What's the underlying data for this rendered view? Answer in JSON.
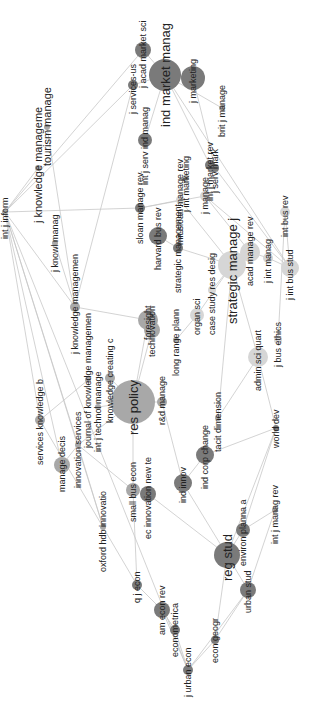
{
  "diagram": {
    "type": "co-citation network map",
    "orientation": "rotated -90deg",
    "colors": {
      "edge": "#c8c8c8",
      "dark": "#7a7a7a",
      "mid": "#a8a8a8",
      "light": "#d6d6d6",
      "label": "#222222"
    },
    "nodes": [
      {
        "id": "ind_market_manag",
        "label": "ind market manag",
        "x": 165,
        "y": 75,
        "r": 16,
        "shade": "dark",
        "fs": 13
      },
      {
        "id": "j_marketing",
        "label": "j marketing",
        "x": 193,
        "y": 78,
        "r": 12,
        "shade": "dark",
        "fs": 9
      },
      {
        "id": "acad_market_sci",
        "label": "j acad market sci",
        "x": 143,
        "y": 50,
        "r": 8,
        "shade": "dark",
        "fs": 9
      },
      {
        "id": "j_services",
        "label": "j services-us",
        "x": 133,
        "y": 85,
        "r": 5,
        "shade": "dark",
        "fs": 9
      },
      {
        "id": "int_j_serv_ind_manag",
        "label": "int j serv ind manag",
        "x": 145,
        "y": 140,
        "r": 7,
        "shade": "dark",
        "fs": 9
      },
      {
        "id": "brit_j_manage",
        "label": "brit j manage",
        "x": 222,
        "y": 108,
        "r": 3,
        "shade": "mid",
        "fs": 9
      },
      {
        "id": "tourism_manage",
        "label": "tourism manage",
        "x": 47,
        "y": 127,
        "r": 3,
        "shade": "mid",
        "fs": 11
      },
      {
        "id": "j_knowledge_manage",
        "label": "j knowledge manageme",
        "x": 38,
        "y": 168,
        "r": 3,
        "shade": "mid",
        "fs": 11
      },
      {
        "id": "int_j_mark",
        "label": "int j market rev",
        "x": 210,
        "y": 165,
        "r": 5,
        "shade": "dark",
        "fs": 9
      },
      {
        "id": "j_serv_mark",
        "label": "j serv mark",
        "x": 215,
        "y": 168,
        "r": 4,
        "shade": "dark",
        "fs": 9
      },
      {
        "id": "sloan_manage_rev",
        "label": "sloan manage rev",
        "x": 140,
        "y": 208,
        "r": 5,
        "shade": "dark",
        "fs": 9
      },
      {
        "id": "mit_sloan_manage_rev",
        "label": "mit sloan manage rev",
        "x": 180,
        "y": 200,
        "r": 4,
        "shade": "light",
        "fs": 9
      },
      {
        "id": "int_marketing",
        "label": "j int marketing",
        "x": 186,
        "y": 178,
        "r": 3,
        "shade": "mid",
        "fs": 9
      },
      {
        "id": "j_manage",
        "label": "j manage",
        "x": 205,
        "y": 196,
        "r": 5,
        "shade": "light",
        "fs": 9
      },
      {
        "id": "harvard_bus_rev",
        "label": "harvard bus rev",
        "x": 158,
        "y": 236,
        "r": 9,
        "shade": "dark",
        "fs": 9
      },
      {
        "id": "strategic_management",
        "label": "strategic management",
        "x": 178,
        "y": 248,
        "r": 5,
        "shade": "dark",
        "fs": 9
      },
      {
        "id": "j_knowl_manag",
        "label": "j knowl manag",
        "x": 55,
        "y": 243,
        "r": 3,
        "shade": "mid",
        "fs": 9
      },
      {
        "id": "knowledge_management",
        "label": "j knowledge managemen",
        "x": 75,
        "y": 307,
        "r": 5,
        "shade": "mid",
        "fs": 9
      },
      {
        "id": "foresight",
        "label": "foresight",
        "x": 148,
        "y": 320,
        "r": 10,
        "shade": "mid",
        "fs": 9
      },
      {
        "id": "technovation",
        "label": "technovation",
        "x": 152,
        "y": 330,
        "r": 8,
        "shade": "mid",
        "fs": 9
      },
      {
        "id": "long_range_plann",
        "label": "long range plann",
        "x": 176,
        "y": 340,
        "r": 3,
        "shade": "mid",
        "fs": 9
      },
      {
        "id": "organ_sci",
        "label": "organ sci",
        "x": 197,
        "y": 315,
        "r": 7,
        "shade": "light",
        "fs": 9
      },
      {
        "id": "case_study_res_desig",
        "label": "case study res desig",
        "x": 212,
        "y": 290,
        "r": 4,
        "shade": "light",
        "fs": 9
      },
      {
        "id": "strategic_manage_j",
        "label": "strategic manage j",
        "x": 232,
        "y": 265,
        "r": 14,
        "shade": "light",
        "fs": 13
      },
      {
        "id": "acad_manage_rev",
        "label": "acad manage rev",
        "x": 250,
        "y": 252,
        "r": 10,
        "shade": "light",
        "fs": 9
      },
      {
        "id": "j_int_manag",
        "label": "j int manag",
        "x": 268,
        "y": 258,
        "r": 5,
        "shade": "light",
        "fs": 9
      },
      {
        "id": "j_int_bus_stud",
        "label": "j int bus stud",
        "x": 290,
        "y": 268,
        "r": 9,
        "shade": "light",
        "fs": 9
      },
      {
        "id": "int_bus_rev",
        "label": "int bus rev",
        "x": 285,
        "y": 212,
        "r": 5,
        "shade": "light",
        "fs": 9
      },
      {
        "id": "j_bus_ethics",
        "label": "j bus ethics",
        "x": 278,
        "y": 340,
        "r": 4,
        "shade": "light",
        "fs": 9
      },
      {
        "id": "admin_sci_quart",
        "label": "admin sci quart",
        "x": 258,
        "y": 357,
        "r": 10,
        "shade": "light",
        "fs": 9
      },
      {
        "id": "res_policy",
        "label": "res policy",
        "x": 133,
        "y": 402,
        "r": 22,
        "shade": "mid",
        "fs": 13
      },
      {
        "id": "knowledge_creating",
        "label": "knowledge creating c",
        "x": 110,
        "y": 378,
        "r": 5,
        "shade": "mid",
        "fs": 9
      },
      {
        "id": "journal_of_knowledge",
        "label": "journal of knowledge managemen",
        "x": 88,
        "y": 380,
        "r": 3,
        "shade": "mid",
        "fs": 9
      },
      {
        "id": "int_j_technol_manage",
        "label": "int j technol manage",
        "x": 98,
        "y": 407,
        "r": 3,
        "shade": "mid",
        "fs": 9
      },
      {
        "id": "services_knowledge",
        "label": "services knowledge b",
        "x": 40,
        "y": 420,
        "r": 5,
        "shade": "mid",
        "fs": 9
      },
      {
        "id": "manage_decis",
        "label": "manage decis",
        "x": 62,
        "y": 465,
        "r": 8,
        "shade": "mid",
        "fs": 9
      },
      {
        "id": "innovation_services",
        "label": "innovation services",
        "x": 78,
        "y": 445,
        "r": 3,
        "shade": "mid",
        "fs": 9
      },
      {
        "id": "rd_manage",
        "label": "r&d manage",
        "x": 162,
        "y": 402,
        "r": 5,
        "shade": "mid",
        "fs": 9
      },
      {
        "id": "tacit_dimension",
        "label": "tacit dimension",
        "x": 218,
        "y": 418,
        "r": 3,
        "shade": "mid",
        "fs": 9
      },
      {
        "id": "world_dev",
        "label": "world dev",
        "x": 276,
        "y": 428,
        "r": 3,
        "shade": "dark",
        "fs": 9
      },
      {
        "id": "small_bus_econ",
        "label": "small bus econ",
        "x": 133,
        "y": 490,
        "r": 7,
        "shade": "mid",
        "fs": 9
      },
      {
        "id": "ec_innovation_new_te",
        "label": "ec innovation new te",
        "x": 148,
        "y": 494,
        "r": 8,
        "shade": "dark",
        "fs": 9
      },
      {
        "id": "ind_innov",
        "label": "ind innov",
        "x": 183,
        "y": 483,
        "r": 9,
        "shade": "dark",
        "fs": 9
      },
      {
        "id": "ind_corp_change",
        "label": "ind corp change",
        "x": 205,
        "y": 455,
        "r": 9,
        "shade": "dark",
        "fs": 9
      },
      {
        "id": "oxford_hdb_innovatio",
        "label": "oxford hdb innovatio",
        "x": 103,
        "y": 527,
        "r": 3,
        "shade": "mid",
        "fs": 9
      },
      {
        "id": "reg_stud",
        "label": "reg stud",
        "x": 227,
        "y": 555,
        "r": 13,
        "shade": "dark",
        "fs": 13
      },
      {
        "id": "environ_planning",
        "label": "environ planna a",
        "x": 243,
        "y": 530,
        "r": 7,
        "shade": "dark",
        "fs": 9
      },
      {
        "id": "int_j_manag_rev",
        "label": "int j manag rev",
        "x": 275,
        "y": 510,
        "r": 3,
        "shade": "mid",
        "fs": 9
      },
      {
        "id": "urban_stud",
        "label": "urban stud",
        "x": 248,
        "y": 590,
        "r": 8,
        "shade": "dark",
        "fs": 9
      },
      {
        "id": "q_j_econ",
        "label": "q j econ",
        "x": 137,
        "y": 585,
        "r": 5,
        "shade": "dark",
        "fs": 9
      },
      {
        "id": "am_econ_rev",
        "label": "am econ rev",
        "x": 162,
        "y": 610,
        "r": 8,
        "shade": "dark",
        "fs": 9
      },
      {
        "id": "econometrica",
        "label": "econometrica",
        "x": 175,
        "y": 630,
        "r": 5,
        "shade": "dark",
        "fs": 9
      },
      {
        "id": "econ_geogr",
        "label": "econ geogr",
        "x": 215,
        "y": 640,
        "r": 4,
        "shade": "dark",
        "fs": 9
      },
      {
        "id": "j_urban_econ",
        "label": "j urban econ",
        "x": 188,
        "y": 670,
        "r": 5,
        "shade": "dark",
        "fs": 9
      },
      {
        "id": "hub_left",
        "label": "int j inform",
        "x": 5,
        "y": 212,
        "r": 3,
        "shade": "mid",
        "fs": 9
      }
    ],
    "edges": [
      [
        "ind_market_manag",
        "j_marketing"
      ],
      [
        "ind_market_manag",
        "acad_market_sci"
      ],
      [
        "ind_market_manag",
        "j_services"
      ],
      [
        "ind_market_manag",
        "int_j_serv_ind_manag"
      ],
      [
        "ind_market_manag",
        "brit_j_manage"
      ],
      [
        "ind_market_manag",
        "int_j_mark"
      ],
      [
        "j_services",
        "hub_left"
      ],
      [
        "acad_market_sci",
        "hub_left"
      ],
      [
        "j_services",
        "knowledge_management"
      ],
      [
        "tourism_manage",
        "knowledge_management"
      ],
      [
        "j_knowledge_manage",
        "hub_left"
      ],
      [
        "hub_left",
        "sloan_manage_rev"
      ],
      [
        "hub_left",
        "knowledge_management"
      ],
      [
        "hub_left",
        "services_knowledge"
      ],
      [
        "hub_left",
        "manage_decis"
      ],
      [
        "hub_left",
        "innovation_services"
      ],
      [
        "sloan_manage_rev",
        "mit_sloan_manage_rev"
      ],
      [
        "sloan_manage_rev",
        "j_manage"
      ],
      [
        "mit_sloan_manage_rev",
        "strategic_manage_j"
      ],
      [
        "j_manage",
        "j_int_bus_stud"
      ],
      [
        "j_manage",
        "acad_manage_rev"
      ],
      [
        "j_serv_mark",
        "int_j_mark"
      ],
      [
        "j_serv_mark",
        "j_int_bus_stud"
      ],
      [
        "int_bus_rev",
        "j_int_bus_stud"
      ],
      [
        "int_bus_rev",
        "j_bus_ethics"
      ],
      [
        "harvard_bus_rev",
        "strategic_management"
      ],
      [
        "strategic_management",
        "strategic_manage_j"
      ],
      [
        "strategic_manage_j",
        "acad_manage_rev"
      ],
      [
        "strategic_manage_j",
        "organ_sci"
      ],
      [
        "strategic_manage_j",
        "case_study_res_desig"
      ],
      [
        "acad_manage_rev",
        "j_int_manag"
      ],
      [
        "j_int_manag",
        "j_int_bus_stud"
      ],
      [
        "admin_sci_quart",
        "strategic_manage_j"
      ],
      [
        "admin_sci_quart",
        "world_dev"
      ],
      [
        "j_knowl_manag",
        "knowledge_management"
      ],
      [
        "knowledge_management",
        "foresight"
      ],
      [
        "foresight",
        "res_policy"
      ],
      [
        "technovation",
        "res_policy"
      ],
      [
        "long_range_plann",
        "organ_sci"
      ],
      [
        "res_policy",
        "knowledge_creating"
      ],
      [
        "res_policy",
        "rd_manage"
      ],
      [
        "res_policy",
        "small_bus_econ"
      ],
      [
        "res_policy",
        "int_j_technol_manage"
      ],
      [
        "journal_of_knowledge",
        "services_knowledge"
      ],
      [
        "innovation_services",
        "manage_decis"
      ],
      [
        "innovation_services",
        "res_policy"
      ],
      [
        "innovation_services",
        "small_bus_econ"
      ],
      [
        "innovation_services",
        "oxford_hdb_innovatio"
      ],
      [
        "rd_manage",
        "ind_innov"
      ],
      [
        "tacit_dimension",
        "admin_sci_quart"
      ],
      [
        "ind_corp_change",
        "world_dev"
      ],
      [
        "ind_corp_change",
        "ind_innov"
      ],
      [
        "ind_innov",
        "reg_stud"
      ],
      [
        "ec_innovation_new_te",
        "reg_stud"
      ],
      [
        "small_bus_econ",
        "q_j_econ"
      ],
      [
        "reg_stud",
        "environ_planning"
      ],
      [
        "reg_stud",
        "urban_stud"
      ],
      [
        "reg_stud",
        "econ_geogr"
      ],
      [
        "environ_planning",
        "int_j_manag_rev"
      ],
      [
        "environ_planning",
        "world_dev"
      ],
      [
        "urban_stud",
        "econ_geogr"
      ],
      [
        "q_j_econ",
        "am_econ_rev"
      ],
      [
        "am_econ_rev",
        "econometrica"
      ],
      [
        "am_econ_rev",
        "j_urban_econ"
      ],
      [
        "econometrica",
        "j_urban_econ"
      ],
      [
        "econ_geogr",
        "j_urban_econ"
      ],
      [
        "urban_stud",
        "j_urban_econ"
      ],
      [
        "hub_left",
        "j_urban_econ"
      ],
      [
        "hub_left",
        "oxford_hdb_innovatio"
      ],
      [
        "services_knowledge",
        "q_j_econ"
      ],
      [
        "int_j_manag_rev",
        "urban_stud"
      ],
      [
        "world_dev",
        "reg_stud"
      ],
      [
        "strategic_manage_j",
        "tacit_dimension"
      ],
      [
        "ind_market_manag",
        "j_int_bus_stud"
      ],
      [
        "j_marketing",
        "j_serv_mark"
      ]
    ]
  }
}
